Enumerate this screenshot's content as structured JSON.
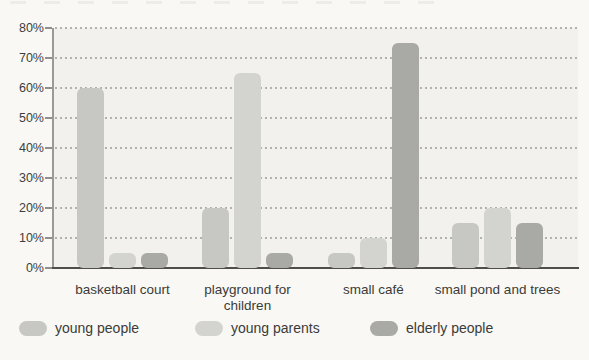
{
  "chart_data": {
    "type": "bar",
    "title": "",
    "categories": [
      "basketball court",
      "playground for\nchildren",
      "small café",
      "small pond and trees"
    ],
    "series": [
      {
        "name": "young people",
        "color": "#c7c7c4",
        "values": [
          60,
          20,
          5,
          15
        ]
      },
      {
        "name": "young parents",
        "color": "#d3d3d0",
        "values": [
          5,
          65,
          10,
          20
        ]
      },
      {
        "name": "elderly people",
        "color": "#a9a9a6",
        "values": [
          5,
          5,
          75,
          15
        ]
      }
    ],
    "yticks": [
      "80%",
      "70%",
      "60%",
      "50%",
      "40%",
      "30%",
      "20%",
      "10%",
      "0%"
    ],
    "ylim": [
      0,
      80
    ],
    "ylabel": "",
    "xlabel": "",
    "grid": "dotted-horizontal",
    "legend_position": "bottom",
    "colors": {
      "plot_background": "#f2f1ee",
      "page_background": "#f9f8f5",
      "axis_line": "#4f4e4a",
      "gridline": "#b2b2af",
      "text": "#3b3b39"
    }
  }
}
